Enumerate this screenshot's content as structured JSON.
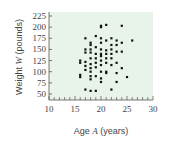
{
  "chart_data": {
    "type": "scatter",
    "title": "",
    "xlabel": "Age A (years)",
    "xlabel_parts": {
      "prefix": "Age ",
      "var": "A",
      "suffix": " (years)"
    },
    "ylabel": "Weight W (pounds)",
    "ylabel_parts": {
      "prefix": "Weight ",
      "var": "W",
      "suffix": " (pounds)"
    },
    "xlim": [
      10,
      30
    ],
    "ylim": [
      30,
      225
    ],
    "xticks": [
      10,
      15,
      20,
      25,
      30
    ],
    "yticks": [
      50,
      75,
      100,
      125,
      150,
      175,
      200,
      225
    ],
    "grid": false,
    "legend": null,
    "plot_background": "#e8f3ea",
    "point_color": "#111111",
    "points": [
      [
        16,
        125
      ],
      [
        16,
        120
      ],
      [
        16,
        93
      ],
      [
        16,
        88
      ],
      [
        17,
        175
      ],
      [
        17,
        150
      ],
      [
        17,
        143
      ],
      [
        17,
        122
      ],
      [
        17,
        113
      ],
      [
        17,
        104
      ],
      [
        17,
        60
      ],
      [
        18,
        165
      ],
      [
        18,
        160
      ],
      [
        18,
        150
      ],
      [
        18,
        143
      ],
      [
        18,
        130
      ],
      [
        18,
        117
      ],
      [
        18,
        108
      ],
      [
        18,
        100
      ],
      [
        18,
        90
      ],
      [
        18,
        83
      ],
      [
        18,
        57
      ],
      [
        19,
        180
      ],
      [
        19,
        155
      ],
      [
        19,
        140
      ],
      [
        19,
        130
      ],
      [
        19,
        120
      ],
      [
        19,
        110
      ],
      [
        19,
        90
      ],
      [
        19,
        57
      ],
      [
        20,
        203
      ],
      [
        20,
        200
      ],
      [
        20,
        175
      ],
      [
        20,
        165
      ],
      [
        20,
        150
      ],
      [
        20,
        140
      ],
      [
        20,
        135
      ],
      [
        20,
        125
      ],
      [
        20,
        115
      ],
      [
        20,
        100
      ],
      [
        20,
        85
      ],
      [
        20,
        77
      ],
      [
        21,
        205
      ],
      [
        21,
        170
      ],
      [
        21,
        148
      ],
      [
        21,
        140
      ],
      [
        21,
        130
      ],
      [
        21,
        120
      ],
      [
        21,
        100
      ],
      [
        21,
        97
      ],
      [
        22,
        175
      ],
      [
        22,
        160
      ],
      [
        22,
        150
      ],
      [
        22,
        140
      ],
      [
        22,
        130
      ],
      [
        22,
        115
      ],
      [
        22,
        60
      ],
      [
        23,
        170
      ],
      [
        23,
        160
      ],
      [
        23,
        145
      ],
      [
        23,
        120
      ],
      [
        23,
        97
      ],
      [
        23,
        77
      ],
      [
        24,
        203
      ],
      [
        24,
        165
      ],
      [
        24,
        145
      ],
      [
        24,
        108
      ],
      [
        25,
        88
      ],
      [
        26,
        170
      ]
    ]
  }
}
